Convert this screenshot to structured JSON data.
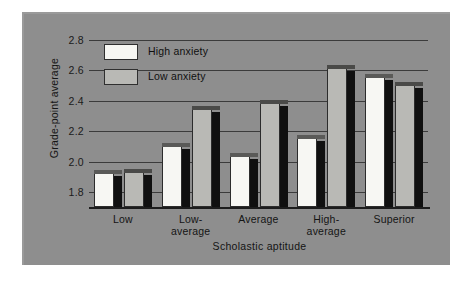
{
  "figure": {
    "panel_color": "#8e8e8e",
    "page_color": "#ffffff"
  },
  "legend": {
    "position": "top-left-inside",
    "entries": [
      {
        "label": "High anxiety",
        "color": "#f7f7f3"
      },
      {
        "label": "Low anxiety",
        "color": "#b9b9b5"
      }
    ]
  },
  "chart_data": {
    "type": "bar",
    "title": "",
    "subtitle": "",
    "xlabel": "Scholastic aptitude",
    "ylabel": "Grade-point average",
    "categories": [
      "Low",
      "Low-average",
      "Average",
      "High-average",
      "Superior"
    ],
    "series": [
      {
        "name": "High anxiety",
        "color": "#f7f7f3",
        "values": [
          1.93,
          2.11,
          2.04,
          2.16,
          2.56
        ]
      },
      {
        "name": "Low anxiety",
        "color": "#b9b9b5",
        "values": [
          1.94,
          2.35,
          2.39,
          2.62,
          2.51
        ]
      }
    ],
    "ylim": [
      1.7,
      2.8
    ],
    "yticks": [
      1.8,
      2.0,
      2.2,
      2.4,
      2.6,
      2.8
    ],
    "ytick_labels": [
      "1.8",
      "2.0",
      "2.2",
      "2.4",
      "2.6",
      "2.8"
    ],
    "grid": "horizontal",
    "bar_style": "3d-shaded",
    "legend_entries": [
      "High anxiety",
      "Low anxiety"
    ]
  }
}
